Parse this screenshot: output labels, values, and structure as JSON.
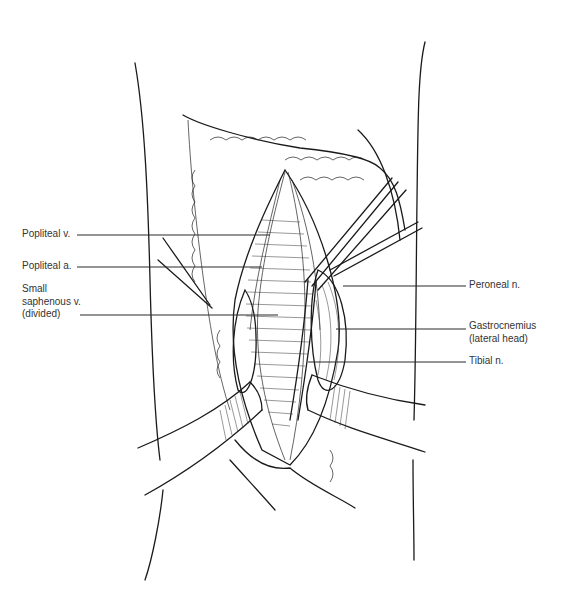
{
  "figure": {
    "colors": {
      "ink": "#1a1a1a",
      "label_text": "#333333",
      "background": "#ffffff"
    }
  },
  "labels_left": [
    {
      "id": "popliteal-v",
      "lines": [
        "Popliteal v."
      ],
      "text_x": 22,
      "text_y": 228,
      "line": {
        "x1": 77,
        "y1": 235,
        "x2": 270,
        "y2": 235
      }
    },
    {
      "id": "popliteal-a",
      "lines": [
        "Popliteal a."
      ],
      "text_x": 22,
      "text_y": 260,
      "line": {
        "x1": 77,
        "y1": 267,
        "x2": 262,
        "y2": 267
      }
    },
    {
      "id": "small-saphenous-v",
      "lines": [
        "Small",
        "saphenous v.",
        "(divided)"
      ],
      "text_x": 22,
      "text_y": 283,
      "line": {
        "x1": 80,
        "y1": 315,
        "x2": 278,
        "y2": 315
      }
    }
  ],
  "labels_right": [
    {
      "id": "peroneal-n",
      "lines": [
        "Peroneal n."
      ],
      "text_x": 469,
      "text_y": 279,
      "line": {
        "x1": 343,
        "y1": 286,
        "x2": 466,
        "y2": 286
      }
    },
    {
      "id": "gastrocnemius-lateral-head",
      "lines": [
        "Gastrocnemius",
        "(lateral head)"
      ],
      "text_x": 469,
      "text_y": 320,
      "line": {
        "x1": 336,
        "y1": 329,
        "x2": 466,
        "y2": 329
      }
    },
    {
      "id": "tibial-n",
      "lines": [
        "Tibial n."
      ],
      "text_x": 469,
      "text_y": 355,
      "line": {
        "x1": 308,
        "y1": 362,
        "x2": 466,
        "y2": 362
      }
    }
  ]
}
